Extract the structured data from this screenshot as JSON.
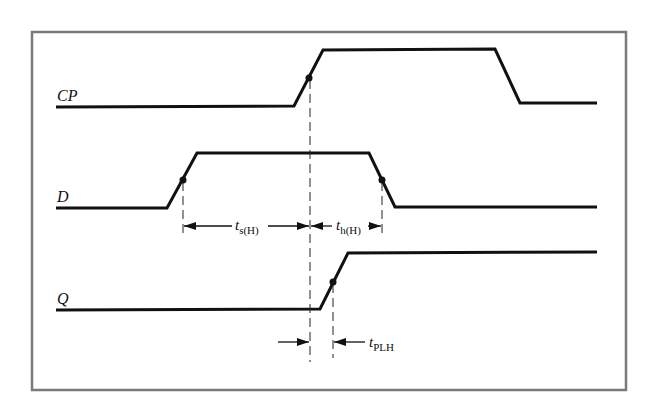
{
  "diagram": {
    "type": "timing-diagram",
    "frame_color": "#7a7a7a",
    "signal_color": "#111111",
    "signals": [
      {
        "name": "CP",
        "label": "CP",
        "points": [
          [
            56,
            107
          ],
          [
            294,
            106
          ],
          [
            323,
            50
          ],
          [
            495,
            49
          ],
          [
            520,
            103
          ],
          [
            597,
            103
          ]
        ],
        "marker": [
          309,
          78
        ]
      },
      {
        "name": "D",
        "label": "D",
        "points": [
          [
            56,
            208
          ],
          [
            167,
            208
          ],
          [
            197,
            153
          ],
          [
            369,
            153
          ],
          [
            395,
            207
          ],
          [
            597,
            207
          ]
        ],
        "markers": [
          [
            183,
            180
          ],
          [
            382,
            180
          ]
        ]
      },
      {
        "name": "Q",
        "label": "Q",
        "points": [
          [
            56,
            310
          ],
          [
            320,
            309
          ],
          [
            348,
            253
          ],
          [
            597,
            252
          ]
        ],
        "marker": [
          333,
          282
        ]
      }
    ],
    "annotations": {
      "setup_time": {
        "t": "t",
        "sub": "s(H)"
      },
      "hold_time": {
        "t": "t",
        "sub": "h(H)"
      },
      "propagation_delay": {
        "t": "t",
        "sub": "PLH"
      }
    }
  }
}
